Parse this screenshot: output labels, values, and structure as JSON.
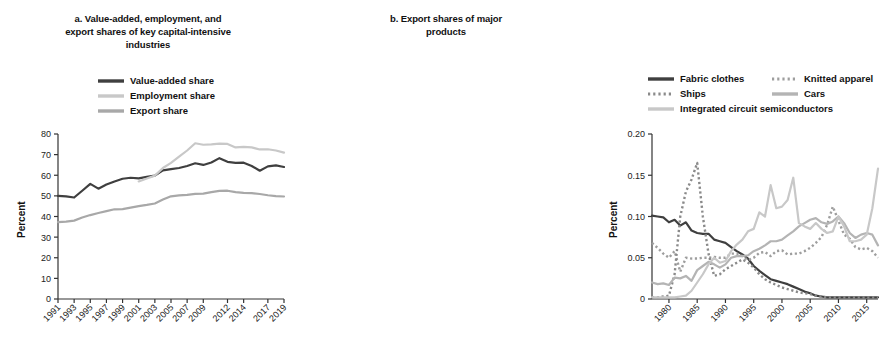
{
  "figure": {
    "panels": [
      "a",
      "b"
    ]
  },
  "panel_a": {
    "title": "a. Value-added, employment, and export shares of key capital-intensive industries",
    "title_lines": [
      "a. Value-added, employment, and",
      "export shares of key capital-intensive",
      "industries"
    ],
    "ylabel": "Percent",
    "legend": [
      {
        "label": "Value-added share",
        "color": "#3f3f3f",
        "style": "solid"
      },
      {
        "label": "Employment share",
        "color": "#c8c8c8",
        "style": "solid"
      },
      {
        "label": "Export share",
        "color": "#a8a8a8",
        "style": "solid"
      }
    ]
  },
  "panel_b": {
    "title": "b. Export shares of major products",
    "title_lines": [
      "b. Export shares of major",
      "products"
    ],
    "ylabel": "Percent",
    "legend": [
      {
        "label": "Fabric clothes",
        "color": "#3f3f3f",
        "style": "solid"
      },
      {
        "label": "Knitted apparel",
        "color": "#9e9e9e",
        "style": "dotted"
      },
      {
        "label": "Ships",
        "color": "#8a8a8a",
        "style": "dotted"
      },
      {
        "label": "Cars",
        "color": "#b4b4b4",
        "style": "solid"
      },
      {
        "label": "Integrated circuit semiconductors",
        "color": "#c8c8c8",
        "style": "solid"
      }
    ]
  },
  "chart_data": [
    {
      "type": "line",
      "panel": "a",
      "title": "a. Value-added, employment, and export shares of key capital-intensive industries",
      "xlabel": "",
      "ylabel": "Percent",
      "ylim": [
        0,
        80
      ],
      "yticks": [
        0,
        10,
        20,
        30,
        40,
        50,
        60,
        70,
        80
      ],
      "ytick_labels": [
        "0",
        "10",
        "20",
        "30",
        "40",
        "50",
        "60",
        "70",
        "80"
      ],
      "xticks": [
        1991,
        1993,
        1995,
        1997,
        1999,
        2001,
        2003,
        2005,
        2007,
        2009,
        2012,
        2014,
        2017,
        2019
      ],
      "xtick_labels": [
        "1991",
        "1993",
        "1995",
        "1997",
        "1999",
        "2001",
        "2003",
        "2005",
        "2007",
        "2009",
        "2012",
        "2014",
        "2017",
        "2019"
      ],
      "xlim": [
        1991,
        2019
      ],
      "grid": false,
      "legend_position": "above-plot",
      "series": [
        {
          "name": "Value-added share",
          "color": "#3f3f3f",
          "style": "solid",
          "x": [
            1991,
            1992,
            1993,
            1994,
            1995,
            1996,
            1997,
            1998,
            1999,
            2000,
            2001,
            2002,
            2003,
            2004,
            2005,
            2006,
            2007,
            2008,
            2009,
            2010,
            2011,
            2012,
            2013,
            2014,
            2015,
            2016,
            2017,
            2018,
            2019
          ],
          "values": [
            50.0,
            49.8,
            49.2,
            52.5,
            55.8,
            53.5,
            55.5,
            57.0,
            58.3,
            58.8,
            58.5,
            59.2,
            59.8,
            62.4,
            63.0,
            63.5,
            64.5,
            65.8,
            65.0,
            66.2,
            68.3,
            66.5,
            66.0,
            66.1,
            64.5,
            62.2,
            64.3,
            64.8,
            64.0
          ]
        },
        {
          "name": "Employment share",
          "color": "#c8c8c8",
          "style": "solid",
          "x": [
            2001,
            2002,
            2003,
            2004,
            2005,
            2006,
            2007,
            2008,
            2009,
            2010,
            2011,
            2012,
            2013,
            2014,
            2015,
            2016,
            2017,
            2018,
            2019
          ],
          "values": [
            57.0,
            58.4,
            59.8,
            63.5,
            66.0,
            69.0,
            72.0,
            75.5,
            74.8,
            75.0,
            75.3,
            75.2,
            73.5,
            73.8,
            73.5,
            72.5,
            72.6,
            72.0,
            71.0
          ]
        },
        {
          "name": "Export share",
          "color": "#a8a8a8",
          "style": "solid",
          "x": [
            1991,
            1992,
            1993,
            1994,
            1995,
            1996,
            1997,
            1998,
            1999,
            2000,
            2001,
            2002,
            2003,
            2004,
            2005,
            2006,
            2007,
            2008,
            2009,
            2010,
            2011,
            2012,
            2013,
            2014,
            2015,
            2016,
            2017,
            2018,
            2019
          ],
          "values": [
            37.3,
            37.5,
            38.0,
            39.5,
            40.7,
            41.7,
            42.6,
            43.5,
            43.6,
            44.3,
            45.0,
            45.6,
            46.3,
            48.2,
            49.8,
            50.2,
            50.5,
            51.0,
            51.1,
            51.8,
            52.4,
            52.5,
            51.8,
            51.5,
            51.3,
            50.9,
            50.3,
            49.9,
            49.7
          ]
        }
      ]
    },
    {
      "type": "line",
      "panel": "b",
      "title": "b. Export shares of major products",
      "xlabel": "",
      "ylabel": "Percent",
      "ylim": [
        0,
        0.2
      ],
      "yticks": [
        0,
        0.05,
        0.1,
        0.15,
        0.2
      ],
      "ytick_labels": [
        "0",
        "0.05",
        "0.10",
        "0.15",
        "0.20"
      ],
      "xticks": [
        1980,
        1985,
        1990,
        1995,
        2000,
        2005,
        2010,
        2015
      ],
      "xtick_labels": [
        "1980",
        "1985",
        "1990",
        "1995",
        "2000",
        "2005",
        "2010",
        "2015"
      ],
      "xlim": [
        1977,
        2017
      ],
      "grid": false,
      "legend_position": "above-plot",
      "series": [
        {
          "name": "Fabric clothes",
          "color": "#3f3f3f",
          "style": "solid",
          "x": [
            1977,
            1978,
            1979,
            1980,
            1981,
            1982,
            1983,
            1984,
            1985,
            1986,
            1987,
            1988,
            1989,
            1990,
            1991,
            1992,
            1993,
            1994,
            1995,
            1996,
            1997,
            1998,
            1999,
            2000,
            2001,
            2002,
            2003,
            2004,
            2005,
            2006,
            2007,
            2008,
            2009,
            2010,
            2011,
            2012,
            2013,
            2014,
            2015,
            2016,
            2017
          ],
          "values": [
            0.101,
            0.1,
            0.099,
            0.093,
            0.096,
            0.089,
            0.093,
            0.083,
            0.08,
            0.079,
            0.079,
            0.072,
            0.07,
            0.068,
            0.063,
            0.058,
            0.054,
            0.049,
            0.04,
            0.034,
            0.029,
            0.024,
            0.022,
            0.02,
            0.018,
            0.015,
            0.012,
            0.009,
            0.007,
            0.004,
            0.003,
            0.002,
            0.002,
            0.002,
            0.002,
            0.002,
            0.002,
            0.002,
            0.002,
            0.002,
            0.002
          ]
        },
        {
          "name": "Knitted apparel",
          "color": "#9e9e9e",
          "style": "dotted",
          "x": [
            1977,
            1978,
            1979,
            1980,
            1981,
            1982,
            1983,
            1984,
            1985,
            1986,
            1987,
            1988,
            1989,
            1990,
            1991,
            1992,
            1993,
            1994,
            1995,
            1996,
            1997,
            1998,
            1999,
            2000,
            2001,
            2002,
            2003,
            2004,
            2005,
            2006,
            2007,
            2008,
            2009,
            2010,
            2011,
            2012,
            2013,
            2014,
            2015,
            2016,
            2017
          ],
          "values": [
            0.068,
            0.062,
            0.055,
            0.05,
            0.058,
            0.033,
            0.05,
            0.049,
            0.049,
            0.05,
            0.05,
            0.051,
            0.05,
            0.05,
            0.055,
            0.055,
            0.052,
            0.047,
            0.05,
            0.056,
            0.057,
            0.052,
            0.058,
            0.059,
            0.054,
            0.055,
            0.055,
            0.058,
            0.062,
            0.068,
            0.075,
            0.09,
            0.112,
            0.095,
            0.078,
            0.073,
            0.063,
            0.06,
            0.062,
            0.058,
            0.05
          ]
        },
        {
          "name": "Ships",
          "color": "#8a8a8a",
          "style": "dotted",
          "x": [
            1977,
            1978,
            1979,
            1980,
            1981,
            1982,
            1983,
            1984,
            1985,
            1986,
            1987,
            1988,
            1989,
            1990,
            1991,
            1992,
            1993,
            1994,
            1995,
            1996,
            1997,
            1998,
            1999,
            2000,
            2001,
            2002,
            2003,
            2004,
            2005,
            2006,
            2007,
            2008,
            2009,
            2010,
            2011,
            2012,
            2013,
            2014,
            2015,
            2016,
            2017
          ],
          "values": [
            0.002,
            0.002,
            0.003,
            0.004,
            0.03,
            0.1,
            0.13,
            0.145,
            0.165,
            0.1,
            0.055,
            0.028,
            0.03,
            0.036,
            0.04,
            0.044,
            0.048,
            0.044,
            0.038,
            0.03,
            0.024,
            0.02,
            0.017,
            0.014,
            0.012,
            0.01,
            0.008,
            0.007,
            0.006,
            0.004,
            0.003,
            0.002,
            0.002,
            0.002,
            0.002,
            0.002,
            0.002,
            0.002,
            0.002,
            0.002,
            0.002
          ]
        },
        {
          "name": "Cars",
          "color": "#b4b4b4",
          "style": "solid",
          "x": [
            1977,
            1978,
            1979,
            1980,
            1981,
            1982,
            1983,
            1984,
            1985,
            1986,
            1987,
            1988,
            1989,
            1990,
            1991,
            1992,
            1993,
            1994,
            1995,
            1996,
            1997,
            1998,
            1999,
            2000,
            2001,
            2002,
            2003,
            2004,
            2005,
            2006,
            2007,
            2008,
            2009,
            2010,
            2011,
            2012,
            2013,
            2014,
            2015,
            2016,
            2017
          ],
          "values": [
            0.02,
            0.018,
            0.019,
            0.017,
            0.026,
            0.025,
            0.028,
            0.022,
            0.035,
            0.04,
            0.045,
            0.042,
            0.038,
            0.042,
            0.05,
            0.052,
            0.052,
            0.053,
            0.058,
            0.061,
            0.065,
            0.07,
            0.07,
            0.072,
            0.077,
            0.082,
            0.088,
            0.092,
            0.096,
            0.098,
            0.093,
            0.091,
            0.094,
            0.1,
            0.092,
            0.08,
            0.074,
            0.078,
            0.08,
            0.078,
            0.065
          ]
        },
        {
          "name": "Integrated circuit semiconductors",
          "color": "#c8c8c8",
          "style": "solid",
          "x": [
            1977,
            1978,
            1979,
            1980,
            1981,
            1982,
            1983,
            1984,
            1985,
            1986,
            1987,
            1988,
            1989,
            1990,
            1991,
            1992,
            1993,
            1994,
            1995,
            1996,
            1997,
            1998,
            1999,
            2000,
            2001,
            2002,
            2003,
            2004,
            2005,
            2006,
            2007,
            2008,
            2009,
            2010,
            2011,
            2012,
            2013,
            2014,
            2015,
            2016,
            2017
          ],
          "values": [
            0.002,
            0.002,
            0.002,
            0.002,
            0.002,
            0.003,
            0.004,
            0.01,
            0.02,
            0.03,
            0.042,
            0.05,
            0.044,
            0.046,
            0.058,
            0.066,
            0.072,
            0.082,
            0.085,
            0.105,
            0.1,
            0.138,
            0.11,
            0.112,
            0.12,
            0.147,
            0.092,
            0.088,
            0.085,
            0.092,
            0.085,
            0.08,
            0.082,
            0.1,
            0.088,
            0.07,
            0.07,
            0.072,
            0.078,
            0.11,
            0.158
          ]
        }
      ]
    }
  ]
}
